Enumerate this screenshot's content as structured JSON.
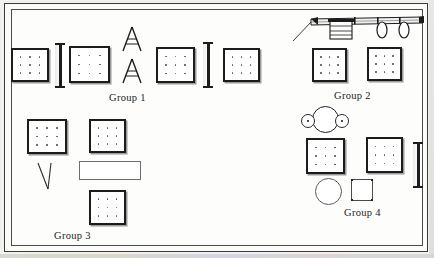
{
  "diagram": {
    "background_color": "#fdfdfb",
    "frame_color": "#3a3a3a",
    "ink_color": "#1c1c1c",
    "width": 434,
    "height": 258
  },
  "labels": {
    "group1": "Group 1",
    "group2": "Group 2",
    "group3": "Group 3",
    "group4": "Group 4"
  },
  "groups": [
    {
      "id": "group-1",
      "label": "Group 1",
      "label_position": {
        "x": 108,
        "y": 92
      },
      "desk_count": 4,
      "beam_count": 2,
      "easel_count": 2
    },
    {
      "id": "group-2",
      "label": "Group 2",
      "label_position": {
        "x": 333,
        "y": 90
      },
      "desk_count": 2,
      "counter_count": 1
    },
    {
      "id": "group-3",
      "label": "Group 3",
      "label_position": {
        "x": 53,
        "y": 230
      },
      "desk_count": 3,
      "thin_rect_count": 1,
      "v_marker_count": 1
    },
    {
      "id": "group-4",
      "label": "Group 4",
      "label_position": {
        "x": 343,
        "y": 207
      },
      "desk_count": 2,
      "round_table_count": 1,
      "circle_count": 1,
      "corner_square_count": 1,
      "beam_count": 1
    }
  ],
  "objects": {
    "desk_blocks": [
      {
        "name": "desk-block-g1-a",
        "group": "group-1",
        "x": 10,
        "y": 47,
        "w": 38,
        "h": 34
      },
      {
        "name": "desk-block-g1-b",
        "group": "group-1",
        "x": 68,
        "y": 45,
        "w": 40,
        "h": 36
      },
      {
        "name": "desk-block-g1-c",
        "group": "group-1",
        "x": 155,
        "y": 46,
        "w": 38,
        "h": 35
      },
      {
        "name": "desk-block-g1-d",
        "group": "group-1",
        "x": 222,
        "y": 47,
        "w": 36,
        "h": 34
      },
      {
        "name": "desk-block-g2-a",
        "group": "group-2",
        "x": 311,
        "y": 47,
        "w": 34,
        "h": 33
      },
      {
        "name": "desk-block-g2-b",
        "group": "group-2",
        "x": 366,
        "y": 46,
        "w": 34,
        "h": 33
      },
      {
        "name": "desk-block-g3-a",
        "group": "group-3",
        "x": 26,
        "y": 118,
        "w": 39,
        "h": 34
      },
      {
        "name": "desk-block-g3-b",
        "group": "group-3",
        "x": 88,
        "y": 118,
        "w": 36,
        "h": 33
      },
      {
        "name": "desk-block-g3-c",
        "group": "group-3",
        "x": 88,
        "y": 189,
        "w": 36,
        "h": 34
      },
      {
        "name": "desk-block-g4-a",
        "group": "group-4",
        "x": 305,
        "y": 137,
        "w": 38,
        "h": 35
      },
      {
        "name": "desk-block-g4-b",
        "group": "group-4",
        "x": 365,
        "y": 136,
        "w": 36,
        "h": 35
      }
    ],
    "beams": [
      {
        "name": "beam-g1-left",
        "group": "group-1",
        "x": 54,
        "y": 42,
        "w": 10,
        "h": 45
      },
      {
        "name": "beam-g1-right",
        "group": "group-1",
        "x": 202,
        "y": 41,
        "w": 10,
        "h": 45
      },
      {
        "name": "beam-g4-right",
        "group": "group-4",
        "x": 412,
        "y": 141,
        "w": 10,
        "h": 45
      }
    ],
    "easels": [
      {
        "name": "easel-upper",
        "group": "group-1",
        "x": 119,
        "y": 24,
        "w": 23,
        "h": 27
      },
      {
        "name": "easel-lower",
        "group": "group-1",
        "x": 119,
        "y": 56,
        "w": 23,
        "h": 27
      }
    ],
    "counter": {
      "name": "counter-assembly",
      "group": "group-2",
      "x": 290,
      "y": 10,
      "w": 130,
      "h": 30
    },
    "round_table": {
      "name": "round-table-two-seats",
      "group": "group-4",
      "x": 300,
      "y": 105,
      "w": 48,
      "h": 27
    },
    "thin_rect": {
      "name": "thin-rectangle-table",
      "group": "group-3",
      "x": 78,
      "y": 160,
      "w": 60,
      "h": 18
    },
    "v_marker": {
      "name": "v-marker",
      "group": "group-3",
      "x": 34,
      "y": 160,
      "w": 20,
      "h": 28
    },
    "plain_circle": {
      "name": "circle-table",
      "group": "group-4",
      "x": 314,
      "y": 177,
      "w": 26,
      "h": 26
    },
    "corner_square": {
      "name": "corner-dot-square",
      "group": "group-4",
      "x": 350,
      "y": 178,
      "w": 22,
      "h": 22
    }
  }
}
